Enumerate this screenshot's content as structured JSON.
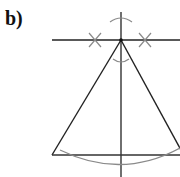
{
  "figure": {
    "label": "b)",
    "colors": {
      "construction_line": "#222222",
      "arc": "#8a8a8a",
      "background": "#ffffff"
    },
    "elements": [
      "horizontal-line",
      "vertical-axis",
      "triangle",
      "top-arc",
      "apex-arc",
      "left-cross-mark",
      "right-cross-mark",
      "base-arc"
    ]
  }
}
